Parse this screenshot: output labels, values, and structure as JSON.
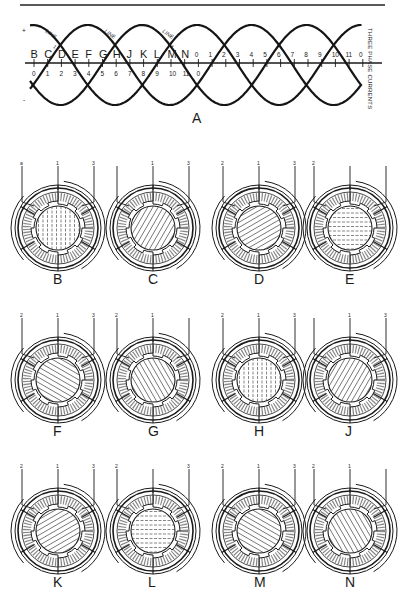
{
  "figure_a": {
    "label": "A",
    "side_caption": "THREE PHASE CURRENTS",
    "plus_sign": "+",
    "minus_sign": "-",
    "line_labels": [
      {
        "text": "LINE",
        "num": "1"
      },
      {
        "text": "LINE",
        "num": "2"
      },
      {
        "text": "LINE",
        "num": "3"
      }
    ],
    "upper_letters": [
      "B",
      "C",
      "D",
      "E",
      "F",
      "G",
      "H",
      "J",
      "K",
      "L",
      "M",
      "N"
    ],
    "upper_numbers_tail": [
      "0",
      "1",
      "2",
      "3",
      "4",
      "5",
      "6",
      "7",
      "8",
      "9",
      "10",
      "11",
      "0"
    ],
    "lower_numbers": [
      "0",
      "1",
      "2",
      "3",
      "4",
      "5",
      "6",
      "7",
      "8",
      "9",
      "10",
      "11",
      "0"
    ]
  },
  "stators": [
    {
      "label": "B",
      "terminals": [
        "a",
        "1",
        "3"
      ],
      "hatch": "vertical"
    },
    {
      "label": "C",
      "terminals": [
        "",
        "1",
        "3"
      ],
      "hatch": "diag60"
    },
    {
      "label": "D",
      "terminals": [
        "2",
        "1",
        "3"
      ],
      "hatch": "diag30"
    },
    {
      "label": "E",
      "terminals": [
        "2",
        "",
        ""
      ],
      "hatch": "horizontal"
    },
    {
      "label": "F",
      "terminals": [
        "2",
        "1",
        "3"
      ],
      "hatch": "diag-30"
    },
    {
      "label": "G",
      "terminals": [
        "2",
        "1",
        ""
      ],
      "hatch": "diag-60"
    },
    {
      "label": "H",
      "terminals": [
        "2",
        "1",
        "3"
      ],
      "hatch": "vertical"
    },
    {
      "label": "J",
      "terminals": [
        "",
        "1",
        "3"
      ],
      "hatch": "diag60"
    },
    {
      "label": "K",
      "terminals": [
        "2",
        "1",
        "3"
      ],
      "hatch": "diag30"
    },
    {
      "label": "L",
      "terminals": [
        "2",
        "",
        "3"
      ],
      "hatch": "horizontal"
    },
    {
      "label": "M",
      "terminals": [
        "2",
        "1",
        "3"
      ],
      "hatch": "diag-30"
    },
    {
      "label": "N",
      "terminals": [
        "2",
        "1",
        ""
      ],
      "hatch": "diag-60"
    }
  ]
}
